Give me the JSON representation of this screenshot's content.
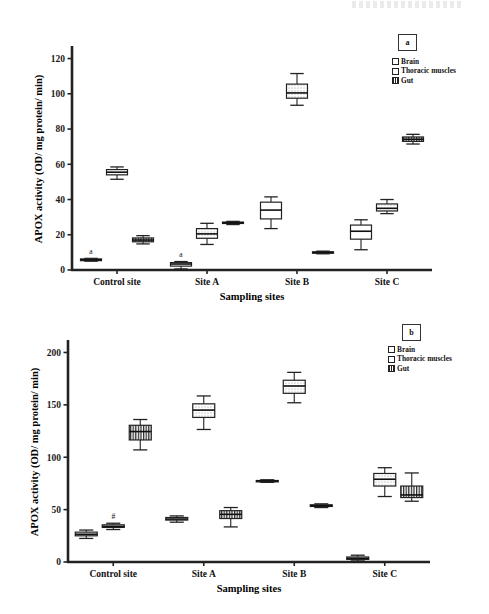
{
  "figure": {
    "background": "#ffffff",
    "axis_color": "#111111",
    "box_edge": "#222222"
  },
  "panels": [
    {
      "tag": "a",
      "axis": {
        "xlabel": "Sampling sites",
        "ylabel": "APOX activity (OD/ mg protein/ min)",
        "yticks": [
          "0",
          "20",
          "40",
          "60",
          "80",
          "100",
          "120"
        ],
        "xticks": [
          "Control site",
          "Site A",
          "Site B",
          "Site C"
        ]
      },
      "legend": {
        "items": [
          {
            "label": "Brain",
            "pattern": "plain"
          },
          {
            "label": "Thoracic muscles",
            "pattern": "dots"
          },
          {
            "label": "Gut",
            "pattern": "vbars"
          }
        ]
      },
      "annotations": [
        {
          "text": "a",
          "site": "Control site",
          "series": "Brain"
        },
        {
          "text": "a",
          "site": "Site A",
          "series": "Brain"
        }
      ]
    },
    {
      "tag": "b",
      "axis": {
        "xlabel": "Sampling sites",
        "ylabel": "APOX activity (OD/ mg protein/ min)",
        "yticks": [
          "0",
          "50",
          "100",
          "150",
          "200"
        ],
        "xticks": [
          "Control site",
          "Site A",
          "Site B",
          "Site C"
        ]
      },
      "legend": {
        "items": [
          {
            "label": "Brain",
            "pattern": "plain"
          },
          {
            "label": "Thoracic muscles",
            "pattern": "dots"
          },
          {
            "label": "Gut",
            "pattern": "vbars"
          }
        ]
      },
      "annotations": [
        {
          "text": "#",
          "site": "Control site",
          "series": "Thoracic muscles"
        }
      ]
    }
  ],
  "chart_data": [
    {
      "id": "panel-a",
      "type": "box",
      "title": "a",
      "xlabel": "Sampling sites",
      "ylabel": "APOX activity (OD/ mg protein/ min)",
      "ylim": [
        0,
        126
      ],
      "yticks": [
        0,
        20,
        40,
        60,
        80,
        100,
        120
      ],
      "grid": false,
      "legend_position": "top-right",
      "categories": [
        "Control site",
        "Site A",
        "Site B",
        "Site C"
      ],
      "series": [
        {
          "name": "Brain",
          "pattern": "plain",
          "boxes": [
            {
              "category": "Control site",
              "whisker_low": 5.0,
              "q1": 5.3,
              "median": 5.8,
              "q3": 6.3,
              "whisker_high": 6.6,
              "annotation": "a"
            },
            {
              "category": "Site A",
              "whisker_low": 0.6,
              "q1": 2.2,
              "median": 3.4,
              "q3": 4.2,
              "whisker_high": 4.8,
              "annotation": "a"
            },
            {
              "category": "Site B",
              "whisker_low": 23.5,
              "q1": 29.0,
              "median": 34.0,
              "q3": 38.5,
              "whisker_high": 41.5,
              "annotation": ""
            },
            {
              "category": "Site C",
              "whisker_low": 11.5,
              "q1": 17.5,
              "median": 22.0,
              "q3": 25.5,
              "whisker_high": 28.5,
              "annotation": ""
            }
          ]
        },
        {
          "name": "Thoracic muscles",
          "pattern": "dots",
          "boxes": [
            {
              "category": "Control site",
              "whisker_low": 51.5,
              "q1": 54.0,
              "median": 55.5,
              "q3": 57.0,
              "whisker_high": 58.5,
              "annotation": ""
            },
            {
              "category": "Site A",
              "whisker_low": 14.5,
              "q1": 18.0,
              "median": 20.5,
              "q3": 23.5,
              "whisker_high": 26.5,
              "annotation": ""
            },
            {
              "category": "Site B",
              "whisker_low": 93.5,
              "q1": 97.5,
              "median": 100.5,
              "q3": 105.5,
              "whisker_high": 111.5,
              "annotation": ""
            },
            {
              "category": "Site C",
              "whisker_low": 32.0,
              "q1": 33.5,
              "median": 35.0,
              "q3": 37.5,
              "whisker_high": 40.0,
              "annotation": ""
            }
          ]
        },
        {
          "name": "Gut",
          "pattern": "vbars",
          "boxes": [
            {
              "category": "Control site",
              "whisker_low": 14.8,
              "q1": 16.0,
              "median": 17.0,
              "q3": 18.2,
              "whisker_high": 19.5,
              "annotation": ""
            },
            {
              "category": "Site A",
              "whisker_low": 25.8,
              "q1": 26.4,
              "median": 26.8,
              "q3": 27.2,
              "whisker_high": 27.6,
              "annotation": ""
            },
            {
              "category": "Site B",
              "whisker_low": 9.2,
              "q1": 9.6,
              "median": 10.0,
              "q3": 10.3,
              "whisker_high": 10.7,
              "annotation": ""
            },
            {
              "category": "Site C",
              "whisker_low": 71.5,
              "q1": 73.0,
              "median": 74.2,
              "q3": 75.5,
              "whisker_high": 77.0,
              "annotation": ""
            }
          ]
        }
      ]
    },
    {
      "id": "panel-b",
      "type": "box",
      "title": "b",
      "xlabel": "Sampling sites",
      "ylabel": "APOX activity (OD/ mg protein/ min)",
      "ylim": [
        0,
        210
      ],
      "yticks": [
        0,
        50,
        100,
        150,
        200
      ],
      "grid": false,
      "legend_position": "top-right",
      "categories": [
        "Control site",
        "Site A",
        "Site B",
        "Site C"
      ],
      "series": [
        {
          "name": "Brain",
          "pattern": "plain",
          "boxes": [
            {
              "category": "Control site",
              "whisker_low": 22.5,
              "q1": 25.0,
              "median": 26.5,
              "q3": 28.5,
              "whisker_high": 30.5,
              "annotation": ""
            },
            {
              "category": "Site A",
              "whisker_low": 38.0,
              "q1": 40.0,
              "median": 41.0,
              "q3": 42.5,
              "whisker_high": 44.0,
              "annotation": ""
            },
            {
              "category": "Site B",
              "whisker_low": 76.0,
              "q1": 76.8,
              "median": 77.3,
              "q3": 77.8,
              "whisker_high": 78.5,
              "annotation": ""
            },
            {
              "category": "Site C",
              "whisker_low": 1.0,
              "q1": 2.5,
              "median": 3.5,
              "q3": 4.8,
              "whisker_high": 6.5,
              "annotation": ""
            }
          ]
        },
        {
          "name": "Thoracic muscles",
          "pattern": "dots",
          "boxes": [
            {
              "category": "Control site",
              "whisker_low": 31.0,
              "q1": 33.0,
              "median": 34.0,
              "q3": 35.5,
              "whisker_high": 37.0,
              "annotation": "#"
            },
            {
              "category": "Site A",
              "whisker_low": 126.5,
              "q1": 138.0,
              "median": 145.0,
              "q3": 151.0,
              "whisker_high": 158.5,
              "annotation": ""
            },
            {
              "category": "Site B",
              "whisker_low": 152.0,
              "q1": 161.0,
              "median": 168.0,
              "q3": 173.5,
              "whisker_high": 181.0,
              "annotation": ""
            },
            {
              "category": "Site C",
              "whisker_low": 62.5,
              "q1": 72.5,
              "median": 79.0,
              "q3": 84.5,
              "whisker_high": 90.0,
              "annotation": ""
            }
          ]
        },
        {
          "name": "Gut",
          "pattern": "vbars",
          "boxes": [
            {
              "category": "Control site",
              "whisker_low": 107.0,
              "q1": 116.5,
              "median": 124.5,
              "q3": 130.5,
              "whisker_high": 136.0,
              "annotation": ""
            },
            {
              "category": "Site A",
              "whisker_low": 33.5,
              "q1": 41.5,
              "median": 45.5,
              "q3": 49.0,
              "whisker_high": 52.0,
              "annotation": ""
            },
            {
              "category": "Site B",
              "whisker_low": 52.0,
              "q1": 53.0,
              "median": 53.8,
              "q3": 54.6,
              "whisker_high": 55.5,
              "annotation": ""
            },
            {
              "category": "Site C",
              "whisker_low": 58.0,
              "q1": 61.5,
              "median": 64.0,
              "q3": 72.5,
              "whisker_high": 85.0,
              "annotation": ""
            }
          ]
        }
      ]
    }
  ]
}
